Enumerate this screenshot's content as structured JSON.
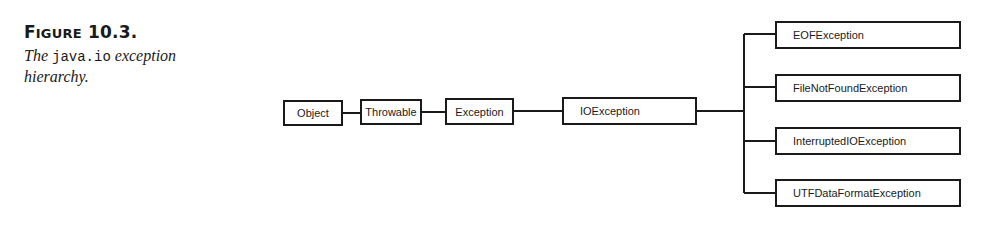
{
  "caption": {
    "figure_label": "Figure 10.3.",
    "figure_label_first": "F",
    "figure_label_sc": "IGURE",
    "figure_number": " 10.3.",
    "text_before": "The ",
    "text_code": "java.io",
    "text_after": " exception hierarchy."
  },
  "diagram": {
    "title": "java.io exception hierarchy",
    "chain": [
      "Object",
      "Throwable",
      "Exception",
      "IOException"
    ],
    "children_of_IOException": [
      "EOFException",
      "FileNotFoundException",
      "InterruptedIOException",
      "UTFDataFormatException"
    ],
    "colors": {
      "line": "#1a1a1a",
      "background": "#ffffff"
    }
  }
}
